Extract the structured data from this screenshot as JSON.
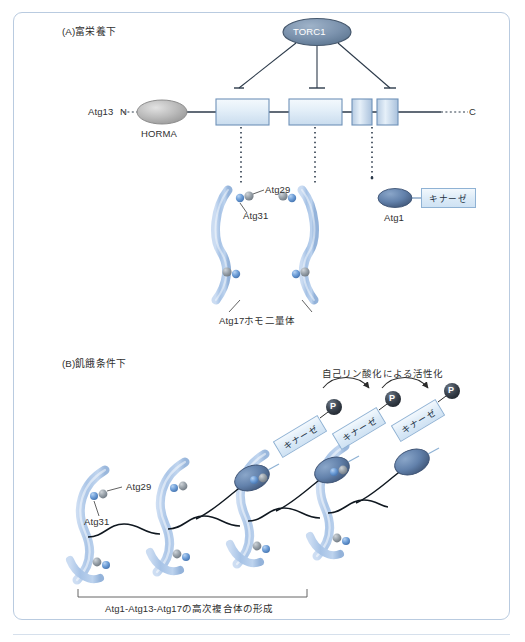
{
  "figure": {
    "panel_a": {
      "label": "(A)富栄養下",
      "kinase_node": {
        "name": "TORC1"
      },
      "protein": {
        "name": "Atg13",
        "n_terminus": "N",
        "c_terminus": "C",
        "domain_label": "HORMA"
      },
      "complex_labels": {
        "atg29": "Atg29",
        "atg31": "Atg31",
        "atg17": "Atg17ホモ二量体"
      },
      "atg1": {
        "name": "Atg1",
        "kinase_label": "キナーゼ"
      }
    },
    "panel_b": {
      "label": "(B)飢餓条件下",
      "activation_text": "自己リン酸化による活性化",
      "phospho_marks": [
        "P",
        "P",
        "P"
      ],
      "kinase_labels": [
        "キナーゼ",
        "キナーゼ",
        "キナーゼ"
      ],
      "subunit_labels": {
        "atg29": "Atg29",
        "atg31": "Atg31"
      },
      "bracket_caption": "Atg1-Atg13-Atg17の高次複合体の形成"
    }
  },
  "colors": {
    "frame_border": "#b9cbe0",
    "torc1_fill": "#7b92ad",
    "torc1_stroke": "#47596e",
    "horma_fill": "#b9b9b9",
    "box_fill": "#dbeaf7",
    "box_stroke": "#6f92b8",
    "crescent_fill": "#a8c4e4",
    "atg31_bead": "#6f9fd8",
    "atg29_bead": "#9aa3ab",
    "atg1_fill": "#5e7ca6",
    "phospho_fill": "#3c4550",
    "line": "#2c3a4a"
  }
}
